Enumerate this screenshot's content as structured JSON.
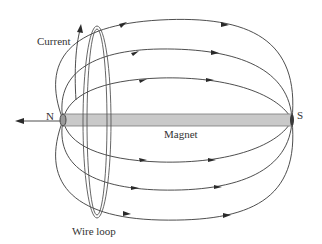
{
  "diagram": {
    "type": "physics-induction",
    "labels": {
      "current": "Current",
      "north": "N",
      "south": "S",
      "magnet": "Magnet",
      "wire_loop": "Wire loop"
    },
    "colors": {
      "line": "#3a3a3a",
      "magnet_fill": "#c9c9c9",
      "magnet_stroke": "#7a7a7a",
      "loop": "#555555",
      "text": "#333333",
      "background": "#ffffff"
    },
    "field_lines": {
      "count_above": 3,
      "count_below": 3,
      "direction": "N to S"
    }
  }
}
